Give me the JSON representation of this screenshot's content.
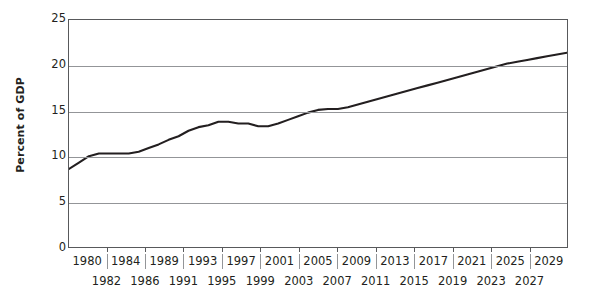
{
  "chart_data": {
    "type": "line",
    "title": "",
    "subtitle": "",
    "xlabel": "",
    "ylabel": "Percent of GDP",
    "xlim": [
      1980,
      2030
    ],
    "ylim": [
      0,
      25
    ],
    "grid": "horizontal",
    "legend": "none",
    "y_ticks": [
      25,
      20,
      15,
      10,
      5,
      0
    ],
    "x_ticks_upper": [
      "1980",
      "1984",
      "1989",
      "1993",
      "1997",
      "2001",
      "2005",
      "2009",
      "2013",
      "2017",
      "2021",
      "2025",
      "2029"
    ],
    "x_ticks_lower": [
      "1982",
      "1986",
      "1991",
      "1995",
      "1999",
      "2003",
      "2007",
      "2011",
      "2015",
      "2019",
      "2023",
      "2027"
    ],
    "series": [
      {
        "name": "Percent of GDP",
        "color": "#231f20",
        "x": [
          1980,
          1981,
          1982,
          1983,
          1984,
          1985,
          1986,
          1987,
          1988,
          1989,
          1990,
          1991,
          1992,
          1993,
          1994,
          1995,
          1996,
          1997,
          1998,
          1999,
          2000,
          2001,
          2002,
          2003,
          2004,
          2005,
          2006,
          2007,
          2008,
          2009,
          2010,
          2011,
          2012,
          2013,
          2014,
          2015,
          2016,
          2017,
          2018,
          2019,
          2020,
          2021,
          2022,
          2023,
          2024,
          2025,
          2026,
          2027,
          2028,
          2029,
          2030
        ],
        "y": [
          8.6,
          9.3,
          10.0,
          10.3,
          10.3,
          10.3,
          10.3,
          10.5,
          10.9,
          11.3,
          11.8,
          12.2,
          12.8,
          13.2,
          13.4,
          13.8,
          13.8,
          13.6,
          13.6,
          13.3,
          13.3,
          13.6,
          14.0,
          14.4,
          14.8,
          15.1,
          15.2,
          15.2,
          15.4,
          15.7,
          16.0,
          16.3,
          16.6,
          16.9,
          17.2,
          17.5,
          17.8,
          18.1,
          18.4,
          18.7,
          19.0,
          19.3,
          19.6,
          19.9,
          20.2,
          20.4,
          20.6,
          20.8,
          21.0,
          21.2,
          21.4
        ]
      }
    ]
  },
  "axis": {
    "y_title": "Percent of GDP"
  },
  "colors": {
    "series_line": "#231f20",
    "gridline": "#939598",
    "axis": "#58595b",
    "text": "#231f20",
    "background": "#ffffff"
  }
}
